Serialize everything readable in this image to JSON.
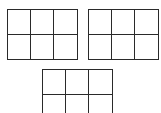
{
  "diagram": {
    "line_color": "#2a2a2a",
    "background_color": "#ffffff",
    "grids": [
      {
        "name": "top-left-grid",
        "rows": 2,
        "columns": 3,
        "cropped": false
      },
      {
        "name": "top-right-grid",
        "rows": 2,
        "columns": 3,
        "cropped": false
      },
      {
        "name": "bottom-grid",
        "rows": 2,
        "columns": 3,
        "cropped": true,
        "cropped_edge": "bottom"
      }
    ]
  }
}
